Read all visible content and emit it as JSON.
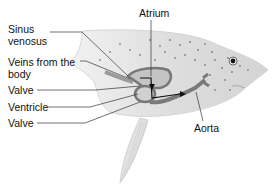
{
  "diagram": {
    "labels": {
      "sinus_venosus_line1": "Sinus",
      "sinus_venosus_line2": "venosus",
      "veins_line1": "Veins from the",
      "veins_line2": "body",
      "valve_upper": "Valve",
      "ventricle": "Ventricle",
      "valve_lower": "Valve",
      "atrium": "Atrium",
      "aorta": "Aorta"
    },
    "colors": {
      "body": "#d9d9d9",
      "body_light": "#eeeeee",
      "spots": "#8a8a8a",
      "vessel": "#7a7a7a",
      "chamber": "#c4c4c4",
      "arrow": "#111111",
      "leader_line": "#333333"
    }
  }
}
